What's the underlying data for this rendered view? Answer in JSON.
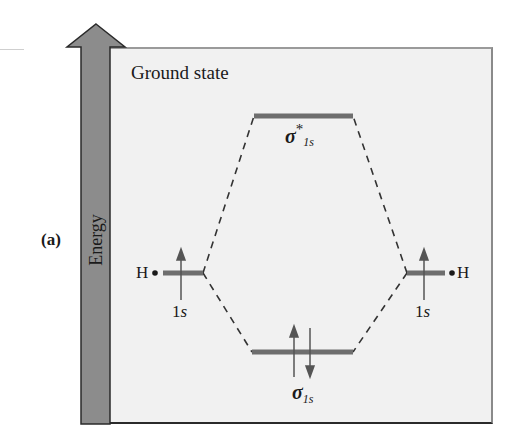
{
  "figure": {
    "panel_label": "(a)",
    "title": "Ground state",
    "axis_label": "Energy",
    "colors": {
      "panel_bg": "#f1f1f1",
      "arrow_fill": "#8c8c8c",
      "level_line": "#6e6e6e",
      "text": "#1a1a1a"
    }
  },
  "levels": {
    "antibonding": {
      "label_main": "σ",
      "label_sup": "*",
      "label_sub": "1s"
    },
    "bonding": {
      "label_main": "σ",
      "label_sub": "1s",
      "electrons": "↑↓"
    },
    "left_atom": {
      "atom": "H•",
      "orbital": "1s",
      "electrons": "↑"
    },
    "right_atom": {
      "atom": "•H",
      "orbital": "1s",
      "electrons": "↑"
    }
  }
}
